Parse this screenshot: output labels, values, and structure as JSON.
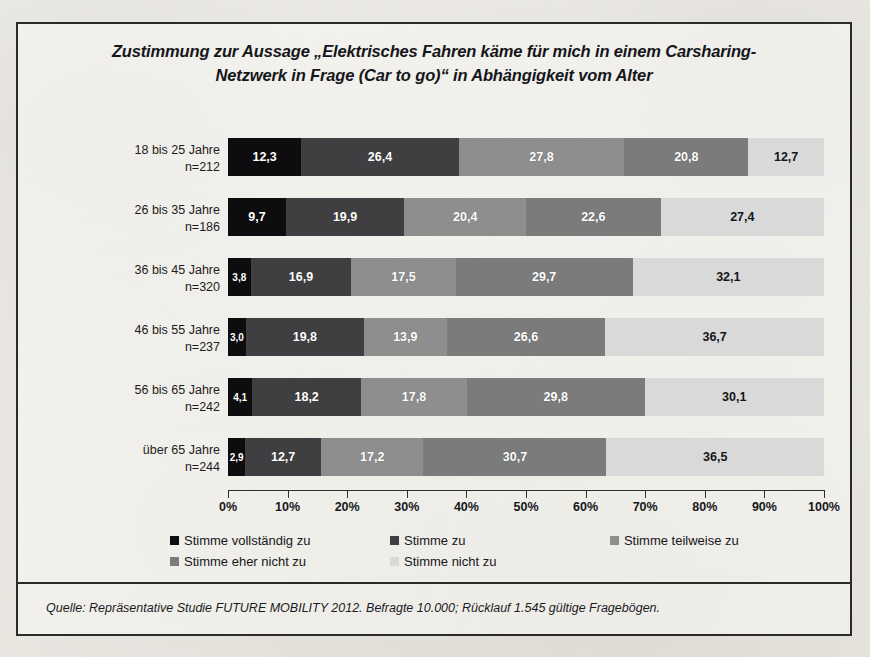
{
  "chart_data": {
    "type": "bar",
    "orientation": "horizontal",
    "stacked": true,
    "normalized_percent": true,
    "title_line1": "Zustimmung zur Aussage „Elektrisches Fahren käme für mich in einem Carsharing-",
    "title_line2": "Netzwerk in Frage (Car to go)“ in Abhängigkeit vom Alter",
    "xlabel": "",
    "ylabel": "",
    "xlim": [
      0,
      100
    ],
    "grid": false,
    "legend_position": "bottom",
    "categories": [
      "18 bis 25 Jahre",
      "26 bis 35 Jahre",
      "36 bis 45 Jahre",
      "46 bis 55 Jahre",
      "56 bis 65 Jahre",
      "über 65 Jahre"
    ],
    "category_n_labels": [
      "n=212",
      "n=186",
      "n=320",
      "n=237",
      "n=242",
      "n=244"
    ],
    "series": [
      {
        "name": "Stimme vollständig zu",
        "color": "#0d0d0f",
        "values": [
          12.3,
          9.7,
          3.8,
          3.0,
          4.1,
          2.9
        ]
      },
      {
        "name": "Stimme zu",
        "color": "#3f3f41",
        "values": [
          26.4,
          19.9,
          16.9,
          19.8,
          18.2,
          12.7
        ]
      },
      {
        "name": "Stimme teilweise zu",
        "color": "#8e8e8e",
        "values": [
          27.8,
          20.4,
          17.5,
          13.9,
          17.8,
          17.2
        ]
      },
      {
        "name": "Stimme eher nicht zu",
        "color": "#7b7b7b",
        "values": [
          20.8,
          22.6,
          29.7,
          26.6,
          29.8,
          30.7
        ]
      },
      {
        "name": "Stimme nicht zu",
        "color": "#d9d9d9",
        "values": [
          12.7,
          27.4,
          32.1,
          36.7,
          30.1,
          36.5
        ]
      }
    ],
    "value_label_format": "comma-decimal",
    "value_labels": [
      [
        "12,3",
        "26,4",
        "27,8",
        "20,8",
        "12,7"
      ],
      [
        "9,7",
        "19,9",
        "20,4",
        "22,6",
        "27,4"
      ],
      [
        "3,8",
        "16,9",
        "17,5",
        "29,7",
        "32,1"
      ],
      [
        "3,0",
        "19,8",
        "13,9",
        "26,6",
        "36,7"
      ],
      [
        "4,1",
        "18,2",
        "17,8",
        "29,8",
        "30,1"
      ],
      [
        "2,9",
        "12,7",
        "17,2",
        "30,7",
        "36,5"
      ]
    ],
    "xticks": [
      0,
      10,
      20,
      30,
      40,
      50,
      60,
      70,
      80,
      90,
      100
    ],
    "xtick_labels": [
      "0%",
      "10%",
      "20%",
      "30%",
      "40%",
      "50%",
      "60%",
      "70%",
      "80%",
      "90%",
      "100%"
    ]
  },
  "source": {
    "text": "Quelle: Repräsentative Studie FUTURE MOBILITY 2012. Befragte 10.000; Rücklauf 1.545 gültige Fragebögen."
  },
  "colors": {
    "frame": "#2b2b2b",
    "page_background": "#efeeea",
    "axis": "#2f2f2f"
  }
}
